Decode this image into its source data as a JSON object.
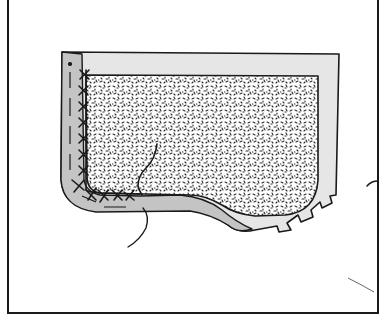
{
  "figure": {
    "colors": {
      "background": "#ffffff",
      "line": "#1a1a1a",
      "seam_allowance_light": "#e6e6e6",
      "fold_dark": "#c4c4c4",
      "speckle": "#2a2a2a"
    },
    "parts": [
      {
        "name": "frame",
        "label": "border frame"
      },
      {
        "name": "pocket-outer",
        "label": "pocket with seam allowance"
      },
      {
        "name": "folded-edge",
        "label": "folded left/bottom edge"
      },
      {
        "name": "interfacing-panel",
        "label": "speckled interfacing"
      },
      {
        "name": "catch-stitches",
        "label": "catch stitching"
      },
      {
        "name": "thread-tail",
        "label": "loose thread"
      },
      {
        "name": "notches",
        "label": "notched curve allowance"
      }
    ]
  }
}
